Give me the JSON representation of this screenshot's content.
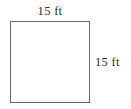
{
  "figure": {
    "type": "geometry-diagram",
    "shape": "square",
    "stroke_color": "#6b6b6b",
    "fill_color": "#ffffff",
    "text_color": "#2b2b2b",
    "labels": {
      "top": "15 ft",
      "right": "15 ft"
    },
    "measurements": {
      "side_value": 15,
      "unit": "ft"
    }
  }
}
